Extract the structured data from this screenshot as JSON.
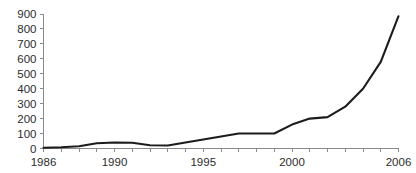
{
  "chart_data": {
    "type": "line",
    "title": "",
    "subtitle": "",
    "xlabel": "",
    "ylabel": "",
    "xlim": [
      1986,
      2006
    ],
    "ylim": [
      0,
      900
    ],
    "grid": false,
    "legend": null,
    "x_tick_labels": [
      "1986",
      "1990",
      "1995",
      "2000",
      "2006"
    ],
    "x_tick_values": [
      1986,
      1990,
      1995,
      2000,
      2006
    ],
    "x_minor_ticks_every": 1,
    "y_tick_labels": [
      "0",
      "100",
      "200",
      "300",
      "400",
      "500",
      "600",
      "700",
      "800",
      "900"
    ],
    "y_tick_values": [
      0,
      100,
      200,
      300,
      400,
      500,
      600,
      700,
      800,
      900
    ],
    "line_color": "#1c1c1c",
    "axis_color": "#8a8a8a",
    "x": [
      1986,
      1987,
      1988,
      1989,
      1990,
      1991,
      1992,
      1993,
      1994,
      1995,
      1996,
      1997,
      1998,
      1999,
      2000,
      2001,
      2002,
      2003,
      2004,
      2005,
      2006
    ],
    "series": [
      {
        "name": "",
        "values": [
          5,
          8,
          15,
          35,
          40,
          38,
          22,
          20,
          40,
          60,
          80,
          100,
          100,
          100,
          160,
          200,
          210,
          280,
          400,
          580,
          885
        ]
      }
    ]
  }
}
